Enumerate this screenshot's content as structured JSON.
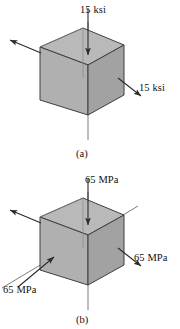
{
  "figure": {
    "background_color": "#ffffff",
    "line_color": "#3a3a3a",
    "face_colors": {
      "top": "#b4b4b4",
      "left": "#a9a9a9",
      "right": "#9e9e9e",
      "interior": "#c9c9c9"
    }
  },
  "panels": [
    {
      "id": "a",
      "caption": "(a)",
      "unit": "ksi",
      "magnitude": "15",
      "labels": {
        "top": "15 ksi",
        "right": "15 ksi"
      },
      "arrows": [
        {
          "name": "top-compression-arrow",
          "direction": "down",
          "label": "15 ksi"
        },
        {
          "name": "right-tension-arrow",
          "direction": "down-right",
          "label": "15 ksi"
        },
        {
          "name": "left-tension-arrow",
          "direction": "up-left",
          "label": ""
        }
      ]
    },
    {
      "id": "b",
      "caption": "(b)",
      "unit": "MPa",
      "magnitude": "65",
      "labels": {
        "top": "65 MPa",
        "right": "65 MPa",
        "left": "65 MPa"
      },
      "arrows": [
        {
          "name": "top-compression-arrow",
          "direction": "down",
          "label": "65 MPa"
        },
        {
          "name": "right-tension-arrow",
          "direction": "down-right",
          "label": "65 MPa"
        },
        {
          "name": "left-upper-tension-arrow",
          "direction": "up-left",
          "label": ""
        },
        {
          "name": "diagonal-tension-arrow",
          "direction": "up-right",
          "label": "65 MPa"
        }
      ]
    }
  ]
}
